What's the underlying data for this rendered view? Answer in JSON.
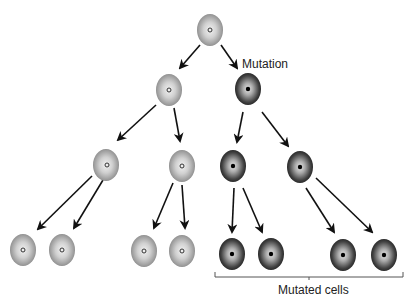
{
  "diagram": {
    "labels": {
      "mutation": "Mutation",
      "mutated_cells": "Mutated cells"
    },
    "colors": {
      "normal_cell_light": "#e6e6e6",
      "normal_cell_dark": "#8a8a8a",
      "mutated_cell_light": "#d8d8d8",
      "mutated_cell_dark": "#1e1e1e",
      "arrow": "#111111"
    },
    "cells": [
      {
        "id": "root",
        "type": "normal",
        "cx": 210,
        "cy": 30
      },
      {
        "id": "n2",
        "type": "normal",
        "cx": 169,
        "cy": 90
      },
      {
        "id": "m2",
        "type": "mutated",
        "cx": 248,
        "cy": 95
      },
      {
        "id": "n3a",
        "type": "normal",
        "cx": 106,
        "cy": 163
      },
      {
        "id": "n3b",
        "type": "normal",
        "cx": 182,
        "cy": 165
      },
      {
        "id": "m3a",
        "type": "mutated",
        "cx": 233,
        "cy": 165
      },
      {
        "id": "m3b",
        "type": "mutated",
        "cx": 300,
        "cy": 167
      },
      {
        "id": "n4a",
        "type": "normal",
        "cx": 23,
        "cy": 248
      },
      {
        "id": "n4b",
        "type": "normal",
        "cx": 62,
        "cy": 248
      },
      {
        "id": "n4c",
        "type": "normal",
        "cx": 144,
        "cy": 250
      },
      {
        "id": "n4d",
        "type": "normal",
        "cx": 182,
        "cy": 250
      },
      {
        "id": "m4a",
        "type": "mutated",
        "cx": 232,
        "cy": 255
      },
      {
        "id": "m4b",
        "type": "mutated",
        "cx": 271,
        "cy": 255
      },
      {
        "id": "m4c",
        "type": "mutated",
        "cx": 343,
        "cy": 256
      },
      {
        "id": "m4d",
        "type": "mutated",
        "cx": 384,
        "cy": 256
      }
    ]
  }
}
